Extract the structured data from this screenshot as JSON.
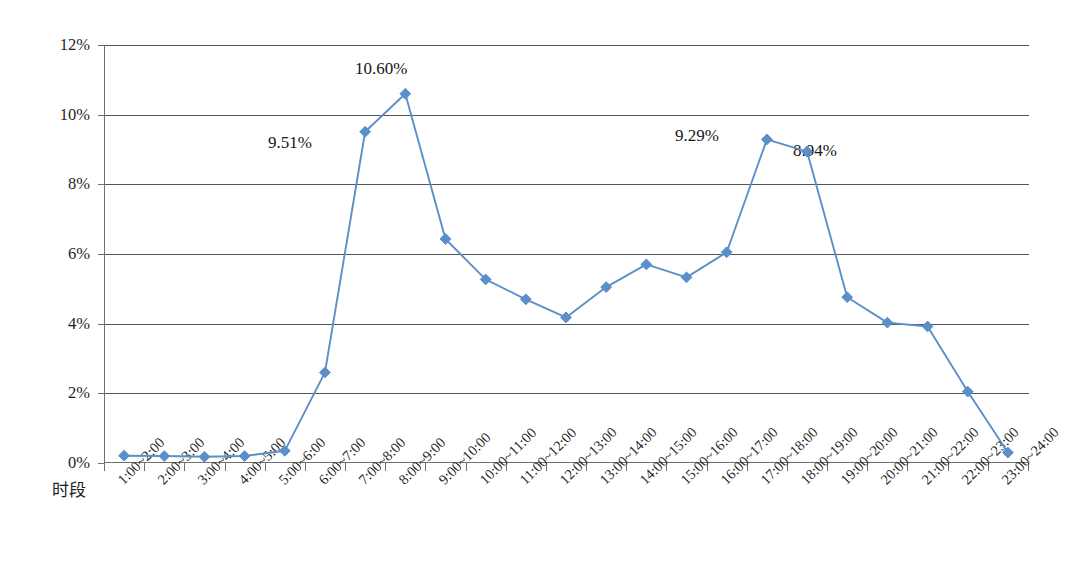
{
  "chart_data": {
    "type": "line",
    "title": "",
    "xlabel": "时段",
    "ylabel": "",
    "ylim": [
      0,
      12
    ],
    "ytick_labels": [
      "0%",
      "2%",
      "4%",
      "6%",
      "8%",
      "10%",
      "12%"
    ],
    "ytick_values": [
      0,
      2,
      4,
      6,
      8,
      10,
      12
    ],
    "grid": true,
    "legend": false,
    "series_color": "#5B8FC9",
    "categories": [
      "1:00~2:00",
      "2:00~3:00",
      "3:00~4:00",
      "4:00~5:00",
      "5:00~6:00",
      "6:00~7:00",
      "7:00~8:00",
      "8:00~9:00",
      "9:00~10:00",
      "10:00~11:00",
      "11:00~12:00",
      "12:00~13:00",
      "13:00~14:00",
      "14:00~15:00",
      "15:00~16:00",
      "16:00~17:00",
      "17:00~18:00",
      "18:00~19:00",
      "19:00~20:00",
      "20:00~21:00",
      "21:00~22:00",
      "22:00~23:00",
      "23:00~24:00"
    ],
    "values": [
      0.21,
      0.2,
      0.18,
      0.2,
      0.35,
      2.6,
      9.51,
      10.6,
      6.43,
      5.27,
      4.7,
      4.18,
      5.05,
      5.7,
      5.33,
      6.05,
      9.29,
      8.94,
      4.76,
      4.03,
      3.92,
      2.05,
      0.3
    ],
    "annotations": [
      {
        "text": "9.51%",
        "category": "7:00~8:00",
        "value": 9.51,
        "x": 268,
        "y": 134
      },
      {
        "text": "10.60%",
        "category": "8:00~9:00",
        "value": 10.6,
        "x": 355,
        "y": 60
      },
      {
        "text": "9.29%",
        "category": "17:00~18:00",
        "value": 9.29,
        "x": 675,
        "y": 127
      },
      {
        "text": "8.94%",
        "category": "18:00~19:00",
        "value": 8.94,
        "x": 793,
        "y": 142
      }
    ]
  }
}
